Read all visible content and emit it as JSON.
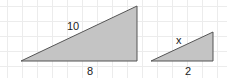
{
  "diagram": {
    "grid": {
      "spacing": 15,
      "color": "#ececec"
    },
    "triangle_fill": "#c4c4c4",
    "triangle_stroke": "#555555",
    "triangles": [
      {
        "name": "large",
        "points": [
          [
            21,
            61
          ],
          [
            137,
            6
          ],
          [
            137,
            61
          ]
        ],
        "labels": {
          "hypotenuse": "10",
          "base": "8"
        }
      },
      {
        "name": "small",
        "points": [
          [
            151,
            61
          ],
          [
            213,
            32
          ],
          [
            213,
            61
          ]
        ],
        "labels": {
          "hypotenuse": "x",
          "base": "2"
        }
      }
    ]
  }
}
